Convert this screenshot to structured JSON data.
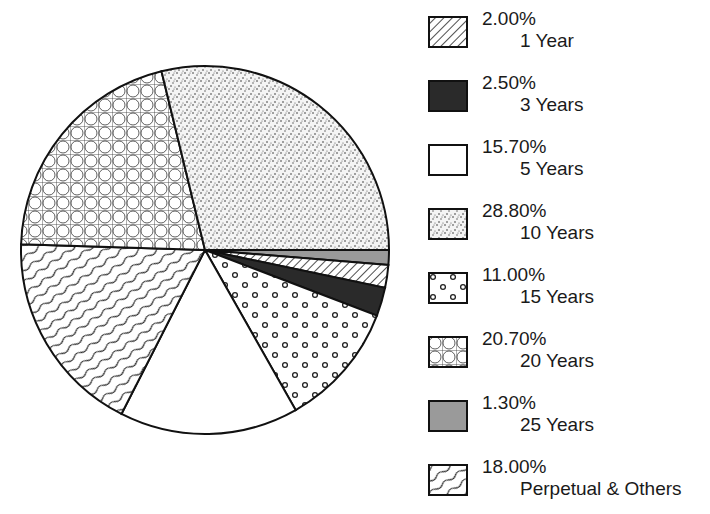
{
  "chart_data": {
    "type": "pie",
    "title": "",
    "legend_position": "right",
    "slices": [
      {
        "label": "1 Year",
        "value": 2.0,
        "display": "2.00%",
        "pattern": "diagonal-hatch"
      },
      {
        "label": "3 Years",
        "value": 2.5,
        "display": "2.50%",
        "pattern": "solid-black"
      },
      {
        "label": "5 Years",
        "value": 15.7,
        "display": "15.70%",
        "pattern": "white"
      },
      {
        "label": "10 Years",
        "value": 28.8,
        "display": "28.80%",
        "pattern": "stipple"
      },
      {
        "label": "15 Years",
        "value": 11.0,
        "display": "11.00%",
        "pattern": "circles"
      },
      {
        "label": "20 Years",
        "value": 20.7,
        "display": "20.70%",
        "pattern": "crosshatch-circles"
      },
      {
        "label": "25 Years",
        "value": 1.3,
        "display": "1.30%",
        "pattern": "solid-gray"
      },
      {
        "label": "Perpetual & Others",
        "value": 18.0,
        "display": "18.00%",
        "pattern": "wavy-lines"
      }
    ],
    "clockwise_order_from_3_oclock": [
      "25 Years",
      "1 Year",
      "3 Years",
      "15 Years",
      "5 Years",
      "Perpetual & Others",
      "20 Years",
      "10 Years"
    ]
  },
  "legend": [
    {
      "pct": "2.00%",
      "label": "1 Year"
    },
    {
      "pct": "2.50%",
      "label": "3 Years"
    },
    {
      "pct": "15.70%",
      "label": "5 Years"
    },
    {
      "pct": "28.80%",
      "label": "10 Years"
    },
    {
      "pct": "11.00%",
      "label": "15 Years"
    },
    {
      "pct": "20.70%",
      "label": "20 Years"
    },
    {
      "pct": "1.30%",
      "label": "25 Years"
    },
    {
      "pct": "18.00%",
      "label": "Perpetual & Others"
    }
  ]
}
